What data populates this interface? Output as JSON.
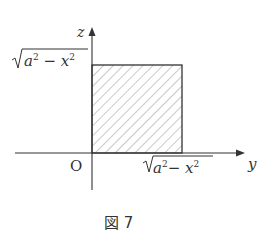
{
  "figure": {
    "caption": "図 7",
    "axes": {
      "vertical_label": "z",
      "horizontal_label": "y",
      "origin_label": "O"
    },
    "region": {
      "shape": "rectangle",
      "fill": "hatched",
      "width_label": "√(a² − x²)",
      "height_label": "√(a² − x²)"
    },
    "labels": {
      "z_tick": {
        "radicand_a": "a",
        "exp": "2",
        "minus": "−",
        "radicand_x": "x"
      },
      "y_tick": {
        "radicand_a": "a",
        "exp": "2",
        "minus": "−",
        "radicand_x": "x"
      }
    }
  }
}
